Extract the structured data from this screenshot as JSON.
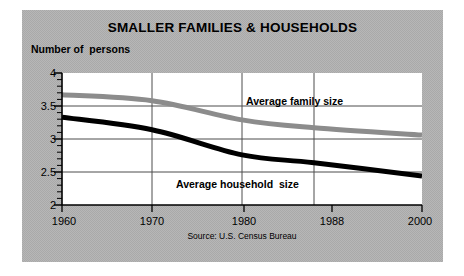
{
  "figure": {
    "title": "SMALLER FAMILIES & HOUSEHOLDS",
    "y_axis_title": "Number of  persons",
    "source": "Source: U.S. Census Bureau",
    "panel_color": "#a9a9a9",
    "plot_background": "#ffffff"
  },
  "labels": {
    "family": "Average family size",
    "household": "Average household  size"
  },
  "chart_data": {
    "type": "line",
    "title": "SMALLER FAMILIES & HOUSEHOLDS",
    "subtitle": "",
    "xlabel": "",
    "ylabel": "Number of  persons",
    "source": "Source: U.S. Census Bureau",
    "x": [
      1960,
      1970,
      1980,
      1988,
      2000
    ],
    "xtick_labels": [
      "1960",
      "1970",
      "1980",
      "1988",
      "2000"
    ],
    "xlim": [
      1960,
      2000
    ],
    "ylim": [
      2,
      4
    ],
    "ytick_labels": [
      "2",
      "2.5",
      "3",
      "3.5",
      "4"
    ],
    "yticks": [
      2,
      2.5,
      3,
      3.5,
      4
    ],
    "y_minor_tick_step": 0.1,
    "grid": true,
    "legend": "inline-annotations",
    "series": [
      {
        "name": "Average family size",
        "color": "#8c8c8c",
        "values": [
          3.67,
          3.58,
          3.29,
          3.17,
          3.06
        ],
        "x": [
          1960,
          1970,
          1980,
          1988,
          2000
        ]
      },
      {
        "name": "Average household  size",
        "color": "#000000",
        "values": [
          3.33,
          3.14,
          2.76,
          2.64,
          2.44
        ],
        "x": [
          1960,
          1970,
          1980,
          1988,
          2000
        ]
      }
    ]
  }
}
